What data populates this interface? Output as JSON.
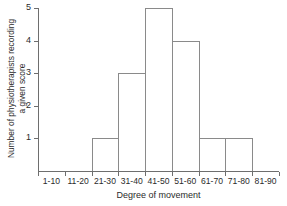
{
  "chart_data": {
    "type": "bar",
    "title": "",
    "subtitle": "",
    "xlabel": "Degree of movement",
    "ylabel_line1": "Number of physiotherapists recording",
    "ylabel_line2": "a given score",
    "categories": [
      "1-10",
      "11-20",
      "21-30",
      "31-40",
      "41-50",
      "51-60",
      "61-70",
      "71-80",
      "81-90"
    ],
    "values": [
      0,
      0,
      1,
      3,
      5,
      4,
      1,
      1,
      0
    ],
    "ytick_labels": [
      "1",
      "2",
      "3",
      "4",
      "5"
    ],
    "ytick_values": [
      1,
      2,
      3,
      4,
      5
    ],
    "ylim": [
      0,
      5
    ],
    "grid": false,
    "legend": null,
    "bar_edge_color": "#8a8a8a",
    "bar_fill_color": "#ffffff",
    "axis_color": "#6e6e6e",
    "text_color": "#2b2b2b",
    "background_color": "#ffffff"
  }
}
